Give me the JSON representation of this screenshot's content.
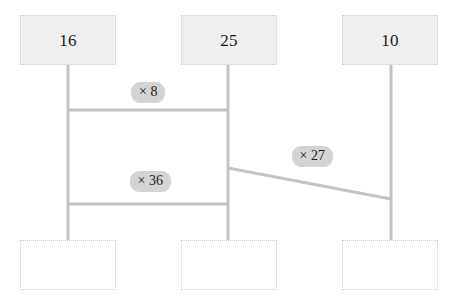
{
  "canvas": {
    "width": 457,
    "height": 305,
    "background": "#ffffff"
  },
  "style": {
    "edge_color": "#c3c3c3",
    "node_fill": "#efefef",
    "node_blank_fill": "#ffffff",
    "node_border": "#cfcfcf",
    "label_badge_fill": "#d4d4d4",
    "text_color": "#1b1b1b"
  },
  "nodes": [
    {
      "id": "top-left",
      "label": "16",
      "x": 20,
      "y": 15,
      "w": 96,
      "h": 50,
      "filled": true
    },
    {
      "id": "top-middle",
      "label": "25",
      "x": 181,
      "y": 15,
      "w": 96,
      "h": 50,
      "filled": true
    },
    {
      "id": "top-right",
      "label": "10",
      "x": 342,
      "y": 15,
      "w": 96,
      "h": 50,
      "filled": true
    },
    {
      "id": "bottom-left",
      "label": "",
      "x": 20,
      "y": 240,
      "w": 96,
      "h": 50,
      "filled": false
    },
    {
      "id": "bottom-middle",
      "label": "",
      "x": 181,
      "y": 240,
      "w": 96,
      "h": 50,
      "filled": false
    },
    {
      "id": "bottom-right",
      "label": "",
      "x": 342,
      "y": 240,
      "w": 96,
      "h": 50,
      "filled": false
    }
  ],
  "edges": [
    {
      "id": "stem-left",
      "x1": 68,
      "y1": 65,
      "x2": 68,
      "y2": 240
    },
    {
      "id": "stem-middle",
      "x1": 228,
      "y1": 65,
      "x2": 228,
      "y2": 240
    },
    {
      "id": "stem-right",
      "x1": 391,
      "y1": 65,
      "x2": 391,
      "y2": 240
    },
    {
      "id": "rung-times-8",
      "x1": 68,
      "y1": 110,
      "x2": 228,
      "y2": 110
    },
    {
      "id": "rung-times-36",
      "x1": 68,
      "y1": 204,
      "x2": 228,
      "y2": 204
    },
    {
      "id": "diagonal-times-27",
      "x1": 228,
      "y1": 168,
      "x2": 391,
      "y2": 199
    }
  ],
  "edge_labels": [
    {
      "id": "label-times-8",
      "text": "× 8",
      "cx": 148,
      "cy": 92
    },
    {
      "id": "label-times-36",
      "text": "× 36",
      "cx": 150,
      "cy": 181
    },
    {
      "id": "label-times-27",
      "text": "× 27",
      "cx": 312,
      "cy": 156
    }
  ]
}
